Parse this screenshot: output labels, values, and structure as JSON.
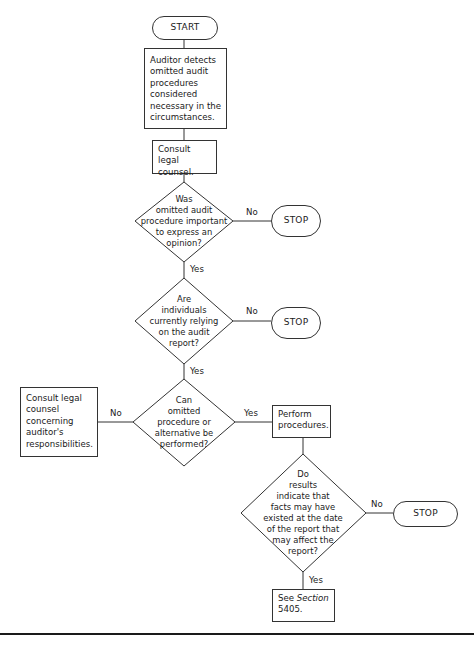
{
  "flowchart": {
    "start": "START",
    "step1": "Auditor detects omitted audit procedures considered necessary in the circumstances.",
    "step2": "Consult legal counsel.",
    "decision1": "Was\nomitted audit\nprocedure important\nto express an\nopinion?",
    "decision2": "Are\nindividuals\ncurrently relying\non the audit\nreport?",
    "decision3": "Can\nomitted\nprocedure or\nalternative be\nperformed?",
    "decision4": "Do\nresults\nindicate that\nfacts may have\nexisted at the date\nof the report that\nmay affect the\nreport?",
    "consult_box": "Consult legal counsel concerning auditor's responsibilities.",
    "perform_box": "Perform procedures.",
    "see_prefix": "See ",
    "see_section": "Section",
    "see_number": "5405.",
    "stop1": "STOP",
    "stop2": "STOP",
    "stop3": "STOP",
    "labels": {
      "d1_no": "No",
      "d1_yes": "Yes",
      "d2_no": "No",
      "d2_yes": "Yes",
      "d3_no": "No",
      "d3_yes": "Yes",
      "d4_no": "No",
      "d4_yes": "Yes"
    }
  }
}
